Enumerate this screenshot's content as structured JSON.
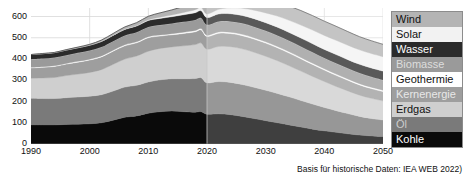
{
  "footer": {
    "note": "Basis für historische Daten: IEA WEB 2022)"
  },
  "legend": {
    "position": "right",
    "items": [
      {
        "label": "Wind",
        "color": "#b4b4b4",
        "text_color": "#111111"
      },
      {
        "label": "Solar",
        "color": "#f2f2f2",
        "text_color": "#111111"
      },
      {
        "label": "Wasser",
        "color": "#2b2b2b",
        "text_color": "#ffffff"
      },
      {
        "label": "Biomasse",
        "color": "#9a9a9a",
        "text_color": "#dddddd"
      },
      {
        "label": "Geothermie",
        "color": "#ffffff",
        "text_color": "#111111"
      },
      {
        "label": "Kernenergie",
        "color": "#9e9e9e",
        "text_color": "#e8e8e8"
      },
      {
        "label": "Erdgas",
        "color": "#cfcfcf",
        "text_color": "#111111"
      },
      {
        "label": "Öl",
        "color": "#7a7a7a",
        "text_color": "#cccccc"
      },
      {
        "label": "Kohle",
        "color": "#0a0a0a",
        "text_color": "#ffffff"
      }
    ]
  },
  "chart_data": {
    "type": "area",
    "stacked": true,
    "title": "",
    "subtitle": "",
    "xlabel": "",
    "ylabel": "",
    "xlim": [
      1990,
      2050
    ],
    "ylim": [
      0,
      640
    ],
    "yticks": [
      0,
      100,
      200,
      300,
      400,
      500,
      600
    ],
    "xticks": [
      1990,
      2000,
      2010,
      2020,
      2030,
      2040,
      2050
    ],
    "grid": true,
    "grid_color": "#d8d8d8",
    "historical_end": 2020,
    "projection_overlay_color": "rgba(255,255,255,0.22)",
    "x": [
      1990,
      1992,
      1994,
      1996,
      1998,
      2000,
      2002,
      2004,
      2006,
      2008,
      2010,
      2012,
      2014,
      2016,
      2018,
      2019,
      2020,
      2022,
      2024,
      2026,
      2028,
      2030,
      2032,
      2034,
      2036,
      2038,
      2040,
      2042,
      2044,
      2046,
      2048,
      2050
    ],
    "series": [
      {
        "name": "Kohle",
        "color": "#0a0a0a",
        "values": [
          90,
          90,
          90,
          92,
          93,
          95,
          100,
          112,
          126,
          132,
          145,
          152,
          155,
          152,
          150,
          152,
          140,
          142,
          138,
          130,
          120,
          110,
          100,
          90,
          80,
          70,
          62,
          55,
          48,
          42,
          38,
          35
        ]
      },
      {
        "name": "Öl",
        "color": "#7a7a7a",
        "values": [
          125,
          124,
          124,
          126,
          128,
          130,
          132,
          137,
          142,
          144,
          147,
          150,
          152,
          155,
          158,
          160,
          148,
          152,
          152,
          150,
          147,
          143,
          138,
          132,
          125,
          118,
          110,
          102,
          95,
          88,
          82,
          78
        ]
      },
      {
        "name": "Erdgas",
        "color": "#cfcfcf",
        "values": [
          95,
          97,
          99,
          104,
          108,
          112,
          118,
          126,
          132,
          138,
          145,
          148,
          150,
          155,
          160,
          163,
          158,
          165,
          168,
          168,
          165,
          160,
          154,
          146,
          138,
          130,
          122,
          114,
          107,
          100,
          95,
          90
        ]
      },
      {
        "name": "Kernenergie",
        "color": "#9e9e9e",
        "values": [
          48,
          50,
          52,
          54,
          56,
          58,
          60,
          62,
          62,
          62,
          63,
          58,
          57,
          58,
          60,
          62,
          60,
          62,
          62,
          62,
          62,
          62,
          61,
          60,
          58,
          56,
          54,
          52,
          50,
          48,
          46,
          44
        ]
      },
      {
        "name": "Geothermie",
        "color": "#ffffff",
        "values": [
          3,
          3,
          3,
          3,
          4,
          4,
          4,
          4,
          5,
          5,
          5,
          5,
          5,
          6,
          6,
          6,
          6,
          6,
          6,
          6,
          6,
          6,
          6,
          6,
          6,
          6,
          6,
          6,
          6,
          6,
          6,
          6
        ]
      },
      {
        "name": "Biomasse",
        "color": "#9a9a9a",
        "values": [
          38,
          38,
          39,
          39,
          40,
          41,
          42,
          43,
          44,
          45,
          46,
          47,
          48,
          49,
          50,
          50,
          49,
          50,
          51,
          52,
          52,
          52,
          52,
          52,
          52,
          52,
          51,
          51,
          50,
          50,
          49,
          48
        ]
      },
      {
        "name": "Wasser",
        "color": "#2b2b2b",
        "values": [
          22,
          23,
          23,
          24,
          24,
          25,
          26,
          27,
          28,
          29,
          30,
          31,
          32,
          33,
          34,
          34,
          34,
          35,
          36,
          37,
          38,
          38,
          39,
          39,
          40,
          40,
          40,
          41,
          41,
          41,
          42,
          42
        ]
      },
      {
        "name": "Solar",
        "color": "#f2f2f2",
        "values": [
          0,
          0,
          0,
          0,
          0,
          0,
          1,
          1,
          2,
          3,
          4,
          6,
          8,
          11,
          14,
          16,
          17,
          22,
          28,
          34,
          40,
          46,
          52,
          57,
          61,
          64,
          66,
          67,
          68,
          68,
          68,
          68
        ]
      },
      {
        "name": "Wind",
        "color": "#b4b4b4",
        "values": [
          0,
          1,
          1,
          2,
          3,
          4,
          6,
          8,
          10,
          13,
          16,
          20,
          24,
          28,
          32,
          34,
          36,
          42,
          48,
          54,
          58,
          62,
          65,
          67,
          68,
          68,
          67,
          66,
          64,
          62,
          60,
          58
        ]
      }
    ]
  }
}
